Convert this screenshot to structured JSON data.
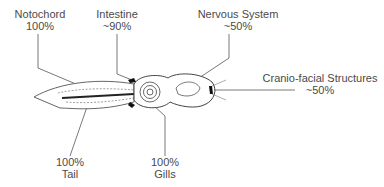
{
  "diagram": {
    "labels": [
      {
        "id": "notochord",
        "name": "Notochord",
        "value": "100%"
      },
      {
        "id": "intestine",
        "name": "Intestine",
        "value": "~90%"
      },
      {
        "id": "nervous-system",
        "name": "Nervous System",
        "value": "~50%"
      },
      {
        "id": "cranio-facial",
        "name": "Cranio-facial Structures",
        "value": "~50%"
      },
      {
        "id": "tail",
        "name": "Tail",
        "value": "100%"
      },
      {
        "id": "gills",
        "name": "Gills",
        "value": "100%"
      }
    ]
  }
}
